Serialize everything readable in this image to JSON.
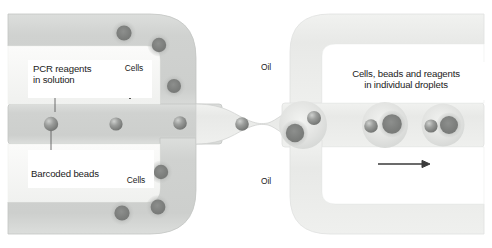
{
  "figure": {
    "type": "diagram",
    "width": 492,
    "height": 248,
    "background_color": "#ffffff"
  },
  "colors": {
    "channel_fill": "#d2d4d2",
    "channel_fill_light": "#e4e5e3",
    "oil_channel_fill": "#eef0ee",
    "channel_wall": "#f4f5f3",
    "channel_outline": "#c3c5c3",
    "bead_color": "#8a8c8a",
    "bead_highlight": "#c9cbc9",
    "cell_core": "#7c7e7c",
    "cell_halo": "#b9bbb9",
    "droplet_fill": "#e9eae8",
    "text_color": "#1b1b1b",
    "arrow_color": "#3a3a3a",
    "leader_color": "#5d5d5d"
  },
  "labels": {
    "pcr_reagents": "PCR reagents\nin solution",
    "cells_top": "Cells",
    "cells_bottom": "Cells",
    "barcoded_beads": "Barcoded beads",
    "oil_top": "Oil",
    "oil_bottom": "Oil",
    "droplets": "Cells, beads and reagents\nin individual droplets"
  },
  "arrows": {
    "cells_top_direction": "down",
    "cells_bottom_direction": "up",
    "oil_top_direction": "down",
    "oil_bottom_direction": "up",
    "flow_left_direction": "right",
    "flow_right_direction": "right"
  },
  "channels": {
    "left": [
      {
        "name": "cells-inlet-top",
        "contents": "cells"
      },
      {
        "name": "beads-reagent-inlet",
        "contents": "barcoded beads in PCR reagent solution"
      },
      {
        "name": "cells-inlet-bottom",
        "contents": "cells"
      }
    ],
    "right": [
      {
        "name": "oil-inlet-top",
        "contents": "oil"
      },
      {
        "name": "droplet-outlet",
        "contents": "droplets containing cells, beads and reagents"
      },
      {
        "name": "oil-inlet-bottom",
        "contents": "oil"
      }
    ]
  },
  "particles": {
    "beads_main_channel": [
      {
        "cx": 51,
        "cy": 124,
        "r": 7.2
      },
      {
        "cx": 116,
        "cy": 124,
        "r": 6.6
      },
      {
        "cx": 180,
        "cy": 123,
        "r": 6.8
      },
      {
        "cx": 242,
        "cy": 124,
        "r": 6.8
      },
      {
        "cx": 310,
        "cy": 121,
        "r": 6.6
      }
    ],
    "cells_top_channel": [
      {
        "cx": 124,
        "cy": 33,
        "r": 8.0
      },
      {
        "cx": 158,
        "cy": 44,
        "r": 7.6
      },
      {
        "cx": 173,
        "cy": 86,
        "r": 7.4
      }
    ],
    "cells_bottom_channel": [
      {
        "cx": 160,
        "cy": 172,
        "r": 7.6
      },
      {
        "cx": 122,
        "cy": 212,
        "r": 8.0
      },
      {
        "cx": 158,
        "cy": 206,
        "r": 7.8
      }
    ],
    "droplets": [
      {
        "cx": 305,
        "cy": 126,
        "r": 25,
        "bead": {
          "cx": 314,
          "cy": 118,
          "r": 7.0
        },
        "cell": {
          "cx": 296,
          "cy": 133,
          "r": 9.5
        }
      },
      {
        "cx": 385,
        "cy": 125,
        "r": 24,
        "bead": {
          "cx": 371,
          "cy": 126,
          "r": 6.8
        },
        "cell": {
          "cx": 392,
          "cy": 124,
          "r": 10.0
        }
      },
      {
        "cx": 443,
        "cy": 125,
        "r": 22,
        "bead": {
          "cx": 431,
          "cy": 126,
          "r": 6.6
        },
        "cell": {
          "cx": 449,
          "cy": 125,
          "r": 9.0
        }
      }
    ]
  }
}
